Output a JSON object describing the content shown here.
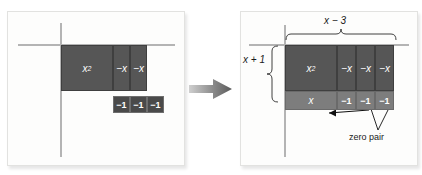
{
  "figure": {
    "type": "algebra-tiles-area-model",
    "flow_arrow_icon": "right-arrow-icon",
    "panels": [
      {
        "id": "before",
        "name": "left-panel",
        "axes": {
          "vertical": true,
          "horizontal": true
        },
        "tiles": [
          {
            "label": "x",
            "sup": "2",
            "kind": "x-squared",
            "shade": "dark"
          },
          {
            "label": "−x",
            "kind": "neg-x",
            "shade": "dark"
          },
          {
            "label": "−x",
            "kind": "neg-x",
            "shade": "dark"
          },
          {
            "label": "−1",
            "kind": "neg-one",
            "shade": "darker"
          },
          {
            "label": "−1",
            "kind": "neg-one",
            "shade": "darker"
          },
          {
            "label": "−1",
            "kind": "neg-one",
            "shade": "darker"
          }
        ]
      },
      {
        "id": "after",
        "name": "right-panel",
        "axes": {
          "vertical": true,
          "horizontal": true
        },
        "tiles": [
          {
            "label": "x",
            "sup": "2",
            "kind": "x-squared",
            "shade": "dark"
          },
          {
            "label": "−x",
            "kind": "neg-x",
            "shade": "dark"
          },
          {
            "label": "−x",
            "kind": "neg-x",
            "shade": "dark"
          },
          {
            "label": "−x",
            "kind": "neg-x",
            "shade": "dark"
          },
          {
            "label": "x",
            "kind": "x",
            "shade": "light"
          },
          {
            "label": "−1",
            "kind": "neg-one",
            "shade": "light"
          },
          {
            "label": "−1",
            "kind": "neg-one",
            "shade": "light"
          },
          {
            "label": "−1",
            "kind": "neg-one",
            "shade": "light"
          }
        ],
        "dimension_labels": {
          "top": "x − 3",
          "left": "x + 1"
        },
        "callouts": [
          {
            "text": "zero pair",
            "name": "zero-pair-callout"
          }
        ]
      }
    ]
  },
  "colors": {
    "tile_dark": "#565656",
    "tile_darker": "#4a4a4a",
    "tile_light": "#7d7d7d",
    "axis": "#b4b4b4",
    "panel_bg": "#fdfdfc",
    "arrow": "#6e6e6e",
    "text_on_tile": "#ffffff",
    "text": "#1a1a1a"
  }
}
